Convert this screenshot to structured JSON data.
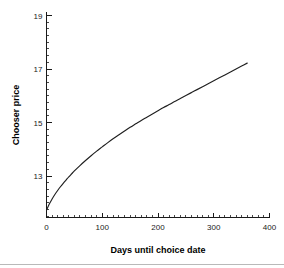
{
  "chart_data": {
    "type": "line",
    "title": "",
    "xlabel": "Days until choice date",
    "ylabel": "Chooser price",
    "xlim": [
      0,
      400
    ],
    "ylim": [
      11.45,
      19.15
    ],
    "grid": false,
    "legend": null,
    "x_ticks_major": [
      0,
      100,
      200,
      300,
      400
    ],
    "x_tick_labels": [
      "0",
      "100",
      "200",
      "300",
      "400"
    ],
    "x_minor_step": 10,
    "y_ticks_major": [
      13,
      15,
      17,
      19
    ],
    "y_tick_labels": [
      "13",
      "15",
      "17",
      "19"
    ],
    "y_minor_step": 0.25,
    "series": [
      {
        "name": "Chooser price",
        "x": [
          0,
          5,
          10,
          15,
          20,
          25,
          30,
          35,
          40,
          45,
          50,
          60,
          70,
          80,
          90,
          100,
          110,
          120,
          130,
          140,
          150,
          160,
          170,
          180,
          190,
          200,
          210,
          220,
          230,
          240,
          250,
          260,
          270,
          280,
          290,
          300,
          310,
          320,
          330,
          340,
          350,
          360
        ],
        "y": [
          11.72,
          11.95,
          12.14,
          12.31,
          12.46,
          12.6,
          12.73,
          12.85,
          12.97,
          13.08,
          13.19,
          13.39,
          13.58,
          13.76,
          13.93,
          14.09,
          14.25,
          14.4,
          14.54,
          14.68,
          14.82,
          14.95,
          15.08,
          15.2,
          15.32,
          15.44,
          15.56,
          15.67,
          15.79,
          15.9,
          16.01,
          16.12,
          16.23,
          16.34,
          16.45,
          16.56,
          16.67,
          16.78,
          16.89,
          17.0,
          17.11,
          17.22
        ]
      }
    ]
  },
  "axes": {
    "x_label": "Days until choice date",
    "y_label": "Chooser price"
  }
}
